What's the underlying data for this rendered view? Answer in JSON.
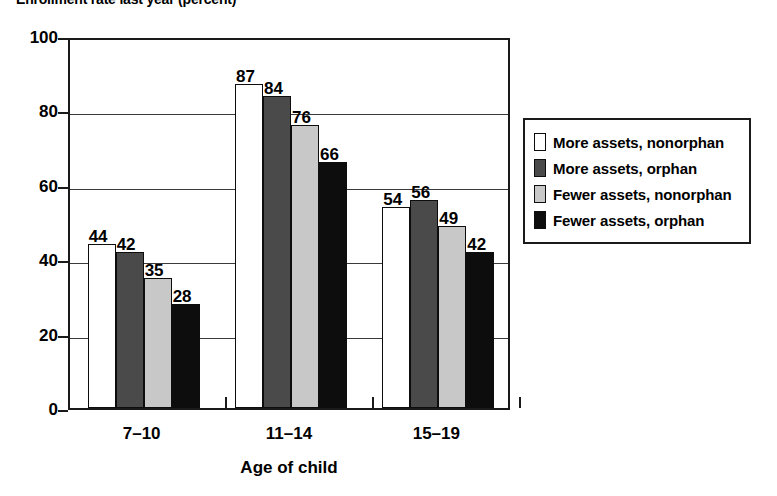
{
  "chart_data": {
    "type": "bar",
    "title": "Enrollment rate last year (percent)",
    "xlabel": "Age of child",
    "ylabel": "",
    "categories": [
      "7–10",
      "11–14",
      "15–19"
    ],
    "ylim": [
      0,
      100
    ],
    "y_ticks": [
      0,
      20,
      40,
      60,
      80,
      100
    ],
    "y_tick_labels": [
      "0",
      "20",
      "40",
      "60",
      "80",
      "100"
    ],
    "grid": "horizontal",
    "legend_position": "right",
    "series": [
      {
        "name": "More assets, nonorphan",
        "color": "#ffffff",
        "values": [
          44,
          87,
          54
        ],
        "labels": [
          "44",
          "87",
          "54"
        ]
      },
      {
        "name": "More assets, orphan",
        "color": "#4a4a4a",
        "values": [
          42,
          84,
          56
        ],
        "labels": [
          "42",
          "84",
          "56"
        ]
      },
      {
        "name": "Fewer assets, nonorphan",
        "color": "#c8c8c8",
        "values": [
          35,
          76,
          49
        ],
        "labels": [
          "35",
          "76",
          "49"
        ]
      },
      {
        "name": "Fewer assets, orphan",
        "color": "#0d0d0d",
        "values": [
          28,
          66,
          42
        ],
        "labels": [
          "28",
          "66",
          "42"
        ]
      }
    ]
  },
  "legend": {
    "items": [
      {
        "label": "More assets, nonorphan",
        "color": "#ffffff"
      },
      {
        "label": "More assets, orphan",
        "color": "#4a4a4a"
      },
      {
        "label": "Fewer assets, nonorphan",
        "color": "#c8c8c8"
      },
      {
        "label": "Fewer assets, orphan",
        "color": "#0d0d0d"
      }
    ]
  },
  "axis": {
    "frame_color": "#1a1a1a",
    "grid_color": "#3a3a3a"
  }
}
